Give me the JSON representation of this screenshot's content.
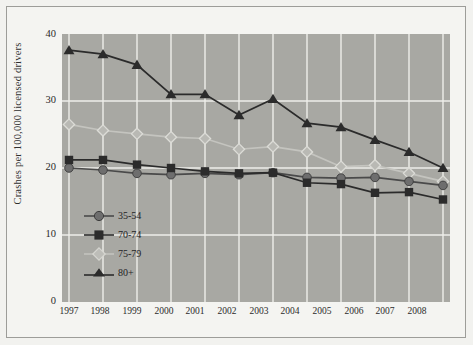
{
  "chart_data": {
    "type": "line",
    "title": "",
    "xlabel": "",
    "ylabel": "Crashes per 100,000 licensed drivers",
    "categories": [
      "1997",
      "1998",
      "1999",
      "2000",
      "2001",
      "2002",
      "2003",
      "2004",
      "2005",
      "2006",
      "2007",
      "2008"
    ],
    "x": [
      1997,
      1998,
      1999,
      2000,
      2001,
      2002,
      2003,
      2004,
      2005,
      2006,
      2007,
      2008
    ],
    "xlim": [
      1997,
      2008
    ],
    "ylim": [
      0,
      40
    ],
    "yticks": [
      0,
      10,
      20,
      30,
      40
    ],
    "grid": true,
    "legend_position": "inside-left-lower",
    "series": [
      {
        "name": "35-54",
        "marker": "circle",
        "color": "#6e6e6e",
        "values": [
          20.0,
          19.7,
          19.2,
          19.0,
          19.2,
          19.0,
          19.3,
          18.6,
          18.5,
          18.6,
          18.0,
          17.4
        ]
      },
      {
        "name": "70-74",
        "marker": "square",
        "color": "#2b2b2b",
        "values": [
          21.2,
          21.2,
          20.5,
          20.0,
          19.5,
          19.2,
          19.3,
          17.8,
          17.6,
          16.3,
          16.4,
          15.3
        ]
      },
      {
        "name": "75-79",
        "marker": "diamond",
        "color": "#cfcfca",
        "values": [
          26.5,
          25.6,
          25.1,
          24.6,
          24.4,
          22.8,
          23.2,
          22.4,
          20.2,
          20.4,
          19.2,
          18.0
        ]
      },
      {
        "name": "80+",
        "marker": "triangle",
        "color": "#2b2b2b",
        "values": [
          37.6,
          37.0,
          35.4,
          31.0,
          31.0,
          27.9,
          30.3,
          26.7,
          26.1,
          24.2,
          22.4,
          20.0
        ]
      }
    ]
  },
  "legend": {
    "items": [
      {
        "label": "35-54",
        "marker": "circle-marker",
        "color": "#6e6e6e"
      },
      {
        "label": "70-74",
        "marker": "square-marker",
        "color": "#2b2b2b"
      },
      {
        "label": "75-79",
        "marker": "diamond-marker",
        "color": "#cfcfca"
      },
      {
        "label": "80+",
        "marker": "triangle-marker",
        "color": "#2b2b2b"
      }
    ]
  },
  "axes": {
    "y_ticks": [
      "40",
      "30",
      "20",
      "10",
      "0"
    ],
    "x_ticks": [
      "1997",
      "1998",
      "1999",
      "2000",
      "2001",
      "2002",
      "2003",
      "2004",
      "2005",
      "2006",
      "2007",
      "2008"
    ],
    "y_title": "Crashes per 100,000 licensed drivers"
  },
  "colors": {
    "panel": "#a8a8a3",
    "figure": "#f2f2ef",
    "grid": "#eeeeea",
    "frame": "#9d9d99",
    "text": "#2b2b2b"
  }
}
